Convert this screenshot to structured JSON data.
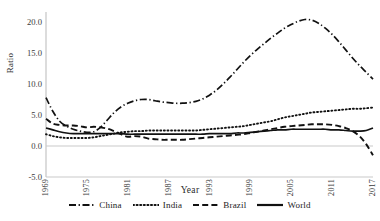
{
  "chart_data": {
    "type": "line",
    "title": "",
    "xlabel": "Year",
    "ylabel": "Ratio",
    "xlim": [
      1969,
      2017
    ],
    "ylim": [
      -5.0,
      20.0
    ],
    "grid": false,
    "legend_position": "bottom",
    "y_ticks": [
      "20.0",
      "15.0",
      "10.0",
      "5.0",
      "0.0",
      "-5.0"
    ],
    "y_tick_values": [
      20.0,
      15.0,
      10.0,
      5.0,
      0.0,
      -5.0
    ],
    "x_ticks": [
      "1969",
      "1975",
      "1981",
      "1987",
      "1993",
      "1999",
      "2005",
      "2011",
      "2017"
    ],
    "x_tick_values": [
      1969,
      1975,
      1981,
      1987,
      1993,
      1999,
      2005,
      2011,
      2017
    ],
    "x": [
      1969,
      1970,
      1971,
      1972,
      1973,
      1974,
      1975,
      1976,
      1977,
      1978,
      1979,
      1980,
      1981,
      1982,
      1983,
      1984,
      1985,
      1986,
      1987,
      1988,
      1989,
      1990,
      1991,
      1992,
      1993,
      1994,
      1995,
      1996,
      1997,
      1998,
      1999,
      2000,
      2001,
      2002,
      2003,
      2004,
      2005,
      2006,
      2007,
      2008,
      2009,
      2010,
      2011,
      2012,
      2013,
      2014,
      2015,
      2016,
      2017
    ],
    "series": [
      {
        "name": "China",
        "style": "dash-dot",
        "color": "#111111",
        "values": [
          7.8,
          5.6,
          4.0,
          3.2,
          2.7,
          2.4,
          2.2,
          2.3,
          3.0,
          4.2,
          5.4,
          6.3,
          6.9,
          7.3,
          7.5,
          7.5,
          7.3,
          7.1,
          7.0,
          6.9,
          6.9,
          7.0,
          7.2,
          7.6,
          8.2,
          9.0,
          10.0,
          11.1,
          12.3,
          13.5,
          14.6,
          15.6,
          16.5,
          17.4,
          18.2,
          19.0,
          19.6,
          20.1,
          20.4,
          20.3,
          19.8,
          19.0,
          18.0,
          16.8,
          15.5,
          14.2,
          13.0,
          11.9,
          10.8
        ]
      },
      {
        "name": "India",
        "style": "dotted",
        "color": "#111111",
        "values": [
          1.9,
          1.6,
          1.4,
          1.3,
          1.3,
          1.3,
          1.3,
          1.4,
          1.6,
          1.8,
          2.0,
          2.2,
          2.3,
          2.4,
          2.4,
          2.5,
          2.5,
          2.5,
          2.5,
          2.5,
          2.5,
          2.5,
          2.5,
          2.6,
          2.7,
          2.8,
          2.9,
          3.0,
          3.1,
          3.2,
          3.4,
          3.6,
          3.8,
          4.0,
          4.3,
          4.6,
          4.8,
          5.0,
          5.2,
          5.4,
          5.5,
          5.6,
          5.7,
          5.8,
          5.9,
          6.0,
          6.0,
          6.1,
          6.2
        ]
      },
      {
        "name": "Brazil",
        "style": "dashed",
        "color": "#111111",
        "values": [
          4.4,
          3.6,
          3.4,
          3.3,
          3.3,
          3.2,
          3.0,
          3.1,
          3.0,
          2.8,
          2.4,
          1.9,
          1.5,
          1.6,
          1.5,
          1.2,
          1.1,
          1.0,
          1.0,
          1.0,
          1.0,
          1.1,
          1.2,
          1.3,
          1.4,
          1.5,
          1.6,
          1.7,
          1.8,
          1.9,
          2.1,
          2.3,
          2.5,
          2.7,
          2.9,
          3.1,
          3.2,
          3.3,
          3.4,
          3.5,
          3.5,
          3.5,
          3.4,
          3.2,
          2.9,
          2.4,
          1.6,
          0.3,
          -1.5
        ]
      },
      {
        "name": "World",
        "style": "solid",
        "color": "#111111",
        "values": [
          2.9,
          2.6,
          2.3,
          2.1,
          2.0,
          2.0,
          2.0,
          2.0,
          2.0,
          2.0,
          2.0,
          2.0,
          1.9,
          1.9,
          1.9,
          1.9,
          1.9,
          1.9,
          1.9,
          1.9,
          1.9,
          1.9,
          1.9,
          1.9,
          2.0,
          2.0,
          2.0,
          2.0,
          2.1,
          2.1,
          2.2,
          2.3,
          2.4,
          2.5,
          2.6,
          2.6,
          2.7,
          2.7,
          2.7,
          2.7,
          2.7,
          2.7,
          2.6,
          2.6,
          2.5,
          2.4,
          2.4,
          2.5,
          2.9
        ]
      }
    ]
  },
  "legend": {
    "items": [
      {
        "label": "China"
      },
      {
        "label": "India"
      },
      {
        "label": "Brazil"
      },
      {
        "label": "World"
      }
    ]
  }
}
